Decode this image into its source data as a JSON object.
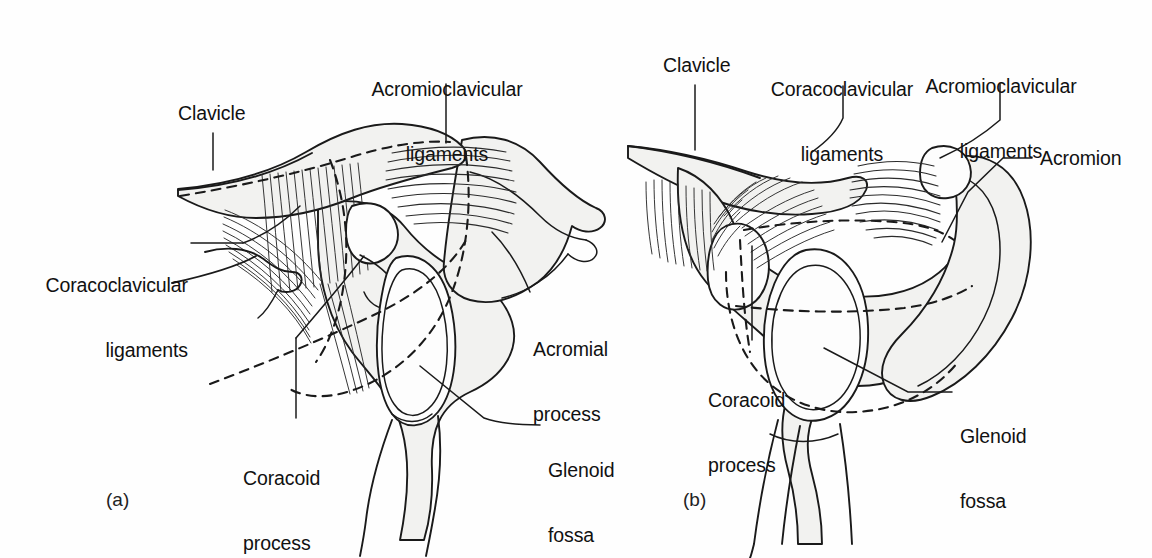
{
  "figure": {
    "background_color": "#fefefe",
    "line_color": "#1a1a1a",
    "bone_fill_color": "#f2f2f0",
    "text_color": "#111111"
  },
  "panels": [
    {
      "tag": "(a)",
      "tag_x": 106,
      "tag_y": 489,
      "view": "lateral",
      "labels": [
        {
          "name": "clavicle",
          "lines": [
            "Clavicle"
          ],
          "x": 178,
          "y": 103,
          "align": "left",
          "leader": "vertical"
        },
        {
          "name": "acromioclavicular-ligaments",
          "lines": [
            "Acromioclavicular",
            "ligaments"
          ],
          "x": 368,
          "y": 36,
          "align": "center",
          "leader": "vertical"
        },
        {
          "name": "coracoclavicular-ligaments",
          "lines": [
            "Coracoclavicular",
            "ligaments"
          ],
          "x": 36,
          "y": 232,
          "align": "left",
          "leader": "horizontal"
        },
        {
          "name": "acromial-process",
          "lines": [
            "Acromial",
            "process"
          ],
          "x": 525,
          "y": 296,
          "align": "left",
          "leader": "diagonal"
        },
        {
          "name": "glenoid-fossa",
          "lines": [
            "Glenoid",
            "fossa"
          ],
          "x": 545,
          "y": 417,
          "align": "left",
          "leader": "diagonal"
        },
        {
          "name": "coracoid-process",
          "lines": [
            "Coracoid",
            "process"
          ],
          "x": 243,
          "y": 425,
          "align": "left",
          "leader": "vertical"
        }
      ]
    },
    {
      "tag": "(b)",
      "tag_x": 683,
      "tag_y": 489,
      "view": "anterior",
      "labels": [
        {
          "name": "clavicle",
          "lines": [
            "Clavicle"
          ],
          "x": 663,
          "y": 55,
          "align": "left",
          "leader": "vertical"
        },
        {
          "name": "coracoclavicular-ligaments",
          "lines": [
            "Coracoclavicular",
            "ligaments"
          ],
          "x": 772,
          "y": 36,
          "align": "center",
          "leader": "diagonal"
        },
        {
          "name": "acromioclavicular-ligaments",
          "lines": [
            "Acromioclavicular",
            "ligaments"
          ],
          "x": 930,
          "y": 33,
          "align": "center",
          "leader": "diagonal"
        },
        {
          "name": "acromion",
          "lines": [
            "Acromion"
          ],
          "x": 1040,
          "y": 148,
          "align": "left",
          "leader": "elbow"
        },
        {
          "name": "coracoid-process",
          "lines": [
            "Coracoid",
            "process"
          ],
          "x": 708,
          "y": 347,
          "align": "left",
          "leader": "vertical"
        },
        {
          "name": "glenoid-fossa",
          "lines": [
            "Glenoid",
            "fossa"
          ],
          "x": 958,
          "y": 383,
          "align": "left",
          "leader": "elbow"
        }
      ]
    }
  ]
}
